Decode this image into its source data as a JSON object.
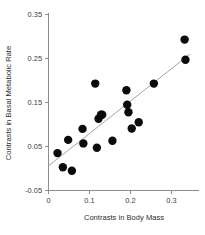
{
  "chart_data": {
    "type": "scatter",
    "title": "",
    "xlabel": "Contrasts in Body Mass",
    "ylabel": "Contrasts in Basal Metabolic Rate",
    "xlim": [
      -0.012,
      0.365
    ],
    "ylim": [
      -0.062,
      0.362
    ],
    "xticks": [
      0,
      0.1,
      0.2,
      0.3
    ],
    "xticklabels": [
      "0",
      "0.1",
      "0.2",
      "0.3"
    ],
    "yticks": [
      -0.05,
      0.05,
      0.15,
      0.25,
      0.35
    ],
    "yticklabels": [
      "-0.05",
      "0.05",
      "0.15",
      "0.25",
      "0.35"
    ],
    "grid": false,
    "legend": null,
    "marker": "filled-circle",
    "marker_color": "#0b0b0b",
    "marker_size": 4.2,
    "points": [
      {
        "x": 0.022,
        "y": 0.035
      },
      {
        "x": 0.035,
        "y": 0.003
      },
      {
        "x": 0.048,
        "y": 0.065
      },
      {
        "x": 0.057,
        "y": -0.005
      },
      {
        "x": 0.083,
        "y": 0.09
      },
      {
        "x": 0.085,
        "y": 0.057
      },
      {
        "x": 0.114,
        "y": 0.193
      },
      {
        "x": 0.118,
        "y": 0.047
      },
      {
        "x": 0.122,
        "y": 0.113
      },
      {
        "x": 0.128,
        "y": 0.122
      },
      {
        "x": 0.131,
        "y": 0.122
      },
      {
        "x": 0.156,
        "y": 0.063
      },
      {
        "x": 0.19,
        "y": 0.178
      },
      {
        "x": 0.192,
        "y": 0.145
      },
      {
        "x": 0.195,
        "y": 0.128
      },
      {
        "x": 0.203,
        "y": 0.091
      },
      {
        "x": 0.22,
        "y": 0.105
      },
      {
        "x": 0.257,
        "y": 0.193
      },
      {
        "x": 0.332,
        "y": 0.293
      },
      {
        "x": 0.334,
        "y": 0.247
      }
    ],
    "fit_line": {
      "type": "linear-regression",
      "x_start": 0.0,
      "y_start": 0.006,
      "x_end": 0.345,
      "y_end": 0.26
    }
  },
  "figure": {
    "background_color": "#ffffff",
    "axis_color": "#8d8d8d",
    "text_color": "#2e2e2e",
    "fit_line_color": "#9a9a9a"
  }
}
